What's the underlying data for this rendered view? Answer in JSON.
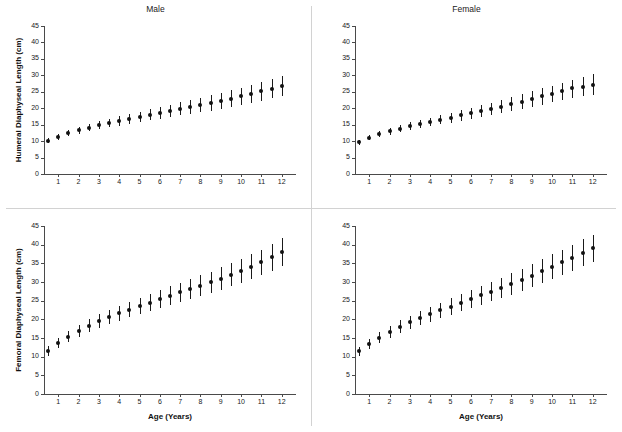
{
  "figure": {
    "background": "#ffffff",
    "marker_color": "#111111",
    "axis_color": "#4a4a4a"
  },
  "chart_data": [
    {
      "type": "scatter",
      "title": "Male",
      "panel": "top-left",
      "xlabel": "",
      "ylabel": "Humeral Diaphyseal Length (cm)",
      "xlim": [
        0.3,
        12.7
      ],
      "ylim": [
        0,
        45
      ],
      "yticks": [
        0,
        5,
        10,
        15,
        20,
        25,
        30,
        35,
        40,
        45
      ],
      "xticks": [
        1,
        2,
        3,
        4,
        5,
        6,
        7,
        8,
        9,
        10,
        11,
        12
      ],
      "grid": false,
      "legend": "none",
      "errorbars": "mean with whiskers (min-max range)",
      "x": [
        0.5,
        1,
        1.5,
        2,
        2.5,
        3,
        3.5,
        4,
        4.5,
        5,
        5.5,
        6,
        6.5,
        7,
        7.5,
        8,
        8.5,
        9,
        9.5,
        10,
        10.5,
        11,
        11.5,
        12
      ],
      "y": [
        10.1,
        11.3,
        12.4,
        13.3,
        14.1,
        14.8,
        15.5,
        16.1,
        16.7,
        17.4,
        18.0,
        18.6,
        19.2,
        19.8,
        20.4,
        21.0,
        21.6,
        22.2,
        22.9,
        23.6,
        24.3,
        25.1,
        25.9,
        26.8
      ],
      "y_low": [
        9.4,
        10.4,
        11.4,
        12.2,
        13.0,
        13.6,
        14.2,
        14.7,
        15.2,
        15.8,
        16.3,
        16.8,
        17.3,
        17.8,
        18.3,
        18.8,
        19.3,
        19.8,
        20.4,
        21.0,
        21.6,
        22.3,
        23.0,
        23.8
      ],
      "y_high": [
        10.8,
        12.2,
        13.4,
        14.4,
        15.2,
        16.0,
        16.8,
        17.5,
        18.2,
        19.0,
        19.7,
        20.4,
        21.1,
        21.8,
        22.5,
        23.2,
        23.9,
        24.6,
        25.4,
        26.2,
        27.0,
        27.9,
        28.8,
        29.8
      ]
    },
    {
      "type": "scatter",
      "title": "Female",
      "panel": "top-right",
      "xlabel": "",
      "ylabel": "",
      "xlim": [
        0.3,
        12.7
      ],
      "ylim": [
        0,
        45
      ],
      "yticks": [
        0,
        5,
        10,
        15,
        20,
        25,
        30,
        35,
        40,
        45
      ],
      "xticks": [
        1,
        2,
        3,
        4,
        5,
        6,
        7,
        8,
        9,
        10,
        11,
        12
      ],
      "grid": false,
      "legend": "none",
      "errorbars": "mean with whiskers (min-max range)",
      "x": [
        0.5,
        1,
        1.5,
        2,
        2.5,
        3,
        3.5,
        4,
        4.5,
        5,
        5.5,
        6,
        6.5,
        7,
        7.5,
        8,
        8.5,
        9,
        9.5,
        10,
        10.5,
        11,
        11.5,
        12
      ],
      "y": [
        9.6,
        11.0,
        12.1,
        13.0,
        13.8,
        14.5,
        15.2,
        15.8,
        16.5,
        17.1,
        17.8,
        18.4,
        19.1,
        19.8,
        20.5,
        21.2,
        22.0,
        22.8,
        23.6,
        24.4,
        25.2,
        26.0,
        26.6,
        27.2
      ],
      "y_low": [
        8.9,
        10.2,
        11.2,
        12.0,
        12.7,
        13.4,
        14.0,
        14.5,
        15.1,
        15.6,
        16.2,
        16.7,
        17.3,
        17.9,
        18.5,
        19.1,
        19.7,
        20.4,
        21.1,
        21.8,
        22.5,
        23.2,
        23.6,
        24.0
      ],
      "y_high": [
        10.3,
        11.8,
        13.0,
        14.0,
        14.9,
        15.7,
        16.4,
        17.1,
        17.9,
        18.6,
        19.4,
        20.1,
        20.9,
        21.7,
        22.5,
        23.3,
        24.2,
        25.1,
        26.0,
        26.9,
        27.8,
        28.7,
        29.5,
        30.3
      ]
    },
    {
      "type": "scatter",
      "title": "",
      "panel": "bottom-left",
      "xlabel": "Age (Years)",
      "ylabel": "Femoral Diaphyseal Length (cm)",
      "xlim": [
        0.3,
        12.7
      ],
      "ylim": [
        0,
        45
      ],
      "yticks": [
        0,
        5,
        10,
        15,
        20,
        25,
        30,
        35,
        40,
        45
      ],
      "xticks": [
        1,
        2,
        3,
        4,
        5,
        6,
        7,
        8,
        9,
        10,
        11,
        12
      ],
      "grid": false,
      "legend": "none",
      "errorbars": "mean with whiskers (min-max range)",
      "x": [
        0.5,
        1,
        1.5,
        2,
        2.5,
        3,
        3.5,
        4,
        4.5,
        5,
        5.5,
        6,
        6.5,
        7,
        7.5,
        8,
        8.5,
        9,
        9.5,
        10,
        10.5,
        11,
        11.5,
        12
      ],
      "y": [
        11.6,
        13.6,
        15.4,
        16.9,
        18.3,
        19.5,
        20.6,
        21.6,
        22.6,
        23.6,
        24.5,
        25.4,
        26.3,
        27.2,
        28.1,
        29.0,
        29.9,
        30.9,
        31.9,
        33.0,
        34.1,
        35.3,
        36.6,
        38.0
      ],
      "y_low": [
        10.3,
        12.2,
        13.9,
        15.3,
        16.6,
        17.7,
        18.7,
        19.6,
        20.5,
        21.4,
        22.2,
        23.0,
        23.8,
        24.6,
        25.4,
        26.2,
        27.0,
        27.9,
        28.8,
        29.8,
        30.8,
        31.9,
        33.0,
        34.2
      ],
      "y_high": [
        12.9,
        15.0,
        16.9,
        18.5,
        20.0,
        21.3,
        22.5,
        23.6,
        24.7,
        25.8,
        26.8,
        27.8,
        28.8,
        29.8,
        30.8,
        31.8,
        32.8,
        33.9,
        35.0,
        36.2,
        37.4,
        38.7,
        40.2,
        41.8
      ]
    },
    {
      "type": "scatter",
      "title": "",
      "panel": "bottom-right",
      "xlabel": "Age (Years)",
      "ylabel": "",
      "xlim": [
        0.3,
        12.7
      ],
      "ylim": [
        0,
        45
      ],
      "yticks": [
        0,
        5,
        10,
        15,
        20,
        25,
        30,
        35,
        40,
        45
      ],
      "xticks": [
        1,
        2,
        3,
        4,
        5,
        6,
        7,
        8,
        9,
        10,
        11,
        12
      ],
      "grid": false,
      "legend": "none",
      "errorbars": "mean with whiskers (min-max range)",
      "x": [
        0.5,
        1,
        1.5,
        2,
        2.5,
        3,
        3.5,
        4,
        4.5,
        5,
        5.5,
        6,
        6.5,
        7,
        7.5,
        8,
        8.5,
        9,
        9.5,
        10,
        10.5,
        11,
        11.5,
        12
      ],
      "y": [
        11.4,
        13.4,
        15.1,
        16.6,
        18.0,
        19.2,
        20.3,
        21.4,
        22.4,
        23.4,
        24.4,
        25.4,
        26.4,
        27.4,
        28.4,
        29.5,
        30.6,
        31.7,
        32.9,
        34.1,
        35.3,
        36.5,
        37.8,
        39.0
      ],
      "y_low": [
        10.2,
        12.0,
        13.6,
        15.0,
        16.3,
        17.4,
        18.4,
        19.4,
        20.3,
        21.2,
        22.1,
        23.0,
        23.9,
        24.8,
        25.7,
        26.6,
        27.6,
        28.6,
        29.7,
        30.8,
        31.9,
        33.0,
        34.2,
        35.3
      ],
      "y_high": [
        12.6,
        14.8,
        16.6,
        18.2,
        19.7,
        21.0,
        22.2,
        23.4,
        24.5,
        25.6,
        26.7,
        27.8,
        28.9,
        30.0,
        31.1,
        32.4,
        33.6,
        34.8,
        36.1,
        37.4,
        38.7,
        40.0,
        41.4,
        42.7
      ]
    }
  ]
}
